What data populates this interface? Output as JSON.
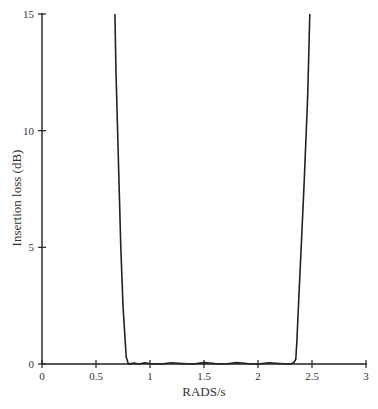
{
  "chart_data": {
    "type": "line",
    "title": "",
    "xlabel": "RADS/s",
    "ylabel": "Insertion loss (dB)",
    "xlim": [
      0,
      3
    ],
    "ylim": [
      0,
      15
    ],
    "x_ticks": [
      0,
      0.5,
      1,
      1.5,
      2,
      2.5,
      3
    ],
    "x_tick_labels": [
      "0",
      "0.5",
      "1",
      "1.5",
      "2",
      "2.5",
      "3"
    ],
    "y_ticks": [
      0,
      5,
      10,
      15
    ],
    "y_tick_labels": [
      "0",
      "5",
      "10",
      "15"
    ],
    "grid": false,
    "legend": null,
    "series": [
      {
        "name": "Insertion loss",
        "color": "#222222",
        "x": [
          0.675,
          0.685,
          0.7,
          0.715,
          0.73,
          0.75,
          0.78,
          0.8,
          0.85,
          0.9,
          0.95,
          1.0,
          1.1,
          1.2,
          1.3,
          1.4,
          1.5,
          1.6,
          1.7,
          1.8,
          1.9,
          2.0,
          2.1,
          2.2,
          2.3,
          2.33,
          2.35,
          2.36,
          2.38,
          2.4,
          2.43,
          2.46,
          2.48
        ],
        "y": [
          15,
          12.5,
          10,
          7.5,
          5,
          2.5,
          0.3,
          0.0,
          0.04,
          0.0,
          0.05,
          0.02,
          0.0,
          0.05,
          0.02,
          0.0,
          0.06,
          0.02,
          0.0,
          0.06,
          0.02,
          0.0,
          0.05,
          0.02,
          0.0,
          0.05,
          0.2,
          1.0,
          3.0,
          5.0,
          8.0,
          11.5,
          15
        ]
      }
    ]
  }
}
